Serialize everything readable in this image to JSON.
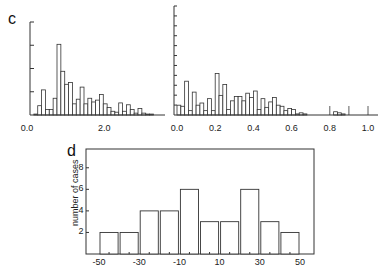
{
  "panels": {
    "c_label": "c",
    "d_label": "d"
  },
  "chart_data": [
    {
      "id": "c-left",
      "type": "bar",
      "title": "",
      "xlabel": "",
      "ylabel": "",
      "xlim": [
        0.0,
        3.5
      ],
      "x_tick_labels": [
        "0.0",
        "2.0"
      ],
      "x_tick_positions": [
        0.0,
        2.0
      ],
      "y_ticks_count": 4,
      "ylim": [
        0,
        100
      ],
      "grid": false,
      "bin_width": 0.1,
      "bin_start": 0.1,
      "values": [
        1,
        10,
        27,
        6,
        6,
        18,
        76,
        47,
        33,
        35,
        12,
        17,
        30,
        12,
        18,
        14,
        16,
        22,
        12,
        8,
        4,
        3,
        13,
        4,
        11,
        6,
        2,
        7,
        2,
        1,
        1
      ]
    },
    {
      "id": "c-right",
      "type": "bar",
      "title": "",
      "xlabel": "",
      "ylabel": "",
      "xlim": [
        0.0,
        1.05
      ],
      "x_tick_labels": [
        "0.0",
        "0.2",
        "0.4",
        "0.6",
        "0.8",
        "1.0"
      ],
      "x_tick_positions": [
        0.0,
        0.2,
        0.4,
        0.6,
        0.8,
        1.0
      ],
      "y_ticks_count": 11,
      "ylim": [
        0,
        100
      ],
      "grid": false,
      "bin_width": 0.02,
      "bin_start": 0.0,
      "values": [
        9,
        8,
        31,
        4,
        21,
        9,
        11,
        4,
        15,
        4,
        38,
        18,
        28,
        5,
        13,
        17,
        17,
        13,
        20,
        16,
        22,
        5,
        15,
        7,
        12,
        16,
        9,
        8,
        4,
        6,
        5,
        1,
        2,
        1,
        0,
        0,
        0,
        0,
        0,
        0,
        0,
        3,
        2,
        1,
        0
      ]
    },
    {
      "id": "d",
      "type": "bar",
      "title": "",
      "xlabel": "",
      "ylabel": "number of cases",
      "categories": [
        "-50",
        "-40",
        "-30",
        "-20",
        "-10",
        "0",
        "10",
        "20",
        "30",
        "40"
      ],
      "bin_edges": [
        -50,
        -40,
        -30,
        -20,
        -10,
        0,
        10,
        20,
        30,
        40,
        50
      ],
      "values": [
        2,
        2,
        4,
        4,
        6,
        3,
        3,
        6,
        3,
        2
      ],
      "x_tick_labels": [
        "-50",
        "-30",
        "-10",
        "10",
        "30",
        "50"
      ],
      "y_tick_labels": [
        "2",
        "4",
        "6",
        "8"
      ],
      "ylim": [
        0,
        9
      ],
      "xlim": [
        -55,
        55
      ],
      "grid": false
    }
  ]
}
